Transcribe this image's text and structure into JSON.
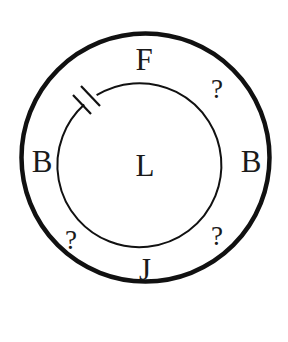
{
  "diagram": {
    "type": "two concentric circles puzzle",
    "outer_circle": {
      "cx": 145.5,
      "cy": 157.5,
      "r": 124,
      "stroke": "#111111",
      "stroke_width": 4.5
    },
    "inner_circle": {
      "cx": 143,
      "cy": 161,
      "r": 82,
      "stroke": "#111111",
      "stroke_width": 2,
      "gap": "break with two parallel tick marks at upper-left"
    },
    "labels": {
      "top": "F",
      "top_right": "?",
      "left": "B",
      "center": "L",
      "right": "B",
      "bottom_left": "?",
      "bottom_right": "?",
      "bottom": "J"
    }
  }
}
